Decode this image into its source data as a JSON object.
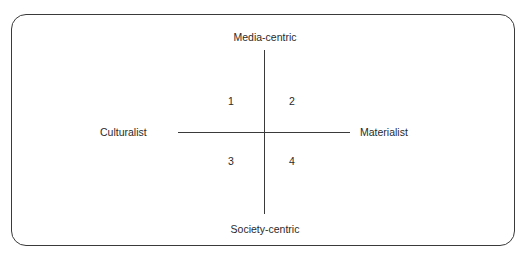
{
  "diagram": {
    "type": "quadrant",
    "axes": {
      "vertical": {
        "top": "Media-centric",
        "bottom": "Society-centric"
      },
      "horizontal": {
        "left": "Culturalist",
        "right": "Materialist"
      }
    },
    "quadrants": [
      {
        "id": "1",
        "position": "top-left",
        "label": "1"
      },
      {
        "id": "2",
        "position": "top-right",
        "label": "2"
      },
      {
        "id": "3",
        "position": "bottom-left",
        "label": "3"
      },
      {
        "id": "4",
        "position": "bottom-right",
        "label": "4"
      }
    ]
  }
}
